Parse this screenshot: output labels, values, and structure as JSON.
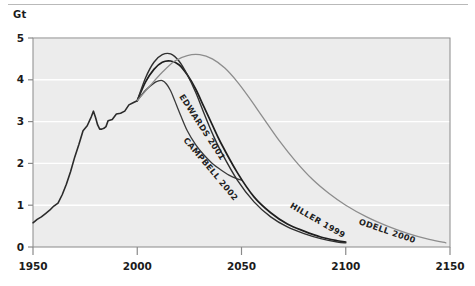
{
  "chart": {
    "unit_label": "Gt",
    "background_color": "#ececec",
    "gridline_color": "#ffffff",
    "axis_color": "#8a8a8a"
  },
  "chart_data": {
    "type": "line",
    "title": "",
    "subtitle": "",
    "xlabel": "",
    "ylabel": "Gt",
    "xlim": [
      1950,
      2150
    ],
    "ylim": [
      0,
      5
    ],
    "xticks": [
      1950,
      2000,
      2050,
      2100,
      2150
    ],
    "yticks": [
      0,
      1,
      2,
      3,
      4,
      5
    ],
    "grid": "horizontal",
    "legend_position": "inline-along-curves",
    "series": [
      {
        "name": "History",
        "label": "",
        "color": "#2b2b2b",
        "width": 1.6,
        "x": [
          1950,
          1952,
          1954,
          1956,
          1958,
          1960,
          1962,
          1964,
          1966,
          1968,
          1970,
          1972,
          1974,
          1976,
          1978,
          1979,
          1980,
          1981,
          1982,
          1983,
          1984,
          1985,
          1986,
          1988,
          1990,
          1992,
          1994,
          1996,
          1998,
          2000
        ],
        "values": [
          0.58,
          0.66,
          0.72,
          0.8,
          0.88,
          0.98,
          1.05,
          1.25,
          1.5,
          1.8,
          2.15,
          2.45,
          2.78,
          2.9,
          3.12,
          3.25,
          3.1,
          2.92,
          2.82,
          2.82,
          2.84,
          2.88,
          3.02,
          3.05,
          3.18,
          3.2,
          3.25,
          3.4,
          3.45,
          3.5
        ]
      },
      {
        "name": "Campbell 2002",
        "label": "CAMPBELL 2002",
        "color": "#3a3a3a",
        "width": 1.3,
        "x": [
          2000,
          2004,
          2008,
          2010,
          2012,
          2014,
          2016,
          2018,
          2020,
          2024,
          2028,
          2032,
          2036,
          2040,
          2044,
          2048,
          2050
        ],
        "values": [
          3.5,
          3.75,
          3.92,
          3.97,
          3.98,
          3.9,
          3.74,
          3.5,
          3.25,
          2.78,
          2.45,
          2.2,
          2.0,
          1.85,
          1.72,
          1.63,
          1.6
        ]
      },
      {
        "name": "Edwards 2001",
        "label": "EDWARDS 2001",
        "color": "#1e1e1e",
        "width": 1.7,
        "x": [
          2000,
          2004,
          2008,
          2012,
          2016,
          2020,
          2024,
          2028,
          2032,
          2036,
          2040,
          2048,
          2056,
          2064,
          2072,
          2080,
          2088,
          2096,
          2100
        ],
        "values": [
          3.5,
          3.95,
          4.25,
          4.42,
          4.45,
          4.36,
          4.12,
          3.78,
          3.35,
          2.92,
          2.5,
          1.78,
          1.2,
          0.82,
          0.55,
          0.38,
          0.24,
          0.15,
          0.12
        ]
      },
      {
        "name": "Hiller 1999",
        "label": "HILLER 1999",
        "color": "#303030",
        "width": 1.4,
        "x": [
          2000,
          2004,
          2008,
          2012,
          2016,
          2020,
          2024,
          2028,
          2032,
          2036,
          2040,
          2048,
          2056,
          2064,
          2072,
          2080,
          2088,
          2096,
          2100
        ],
        "values": [
          3.5,
          4.05,
          4.42,
          4.6,
          4.62,
          4.45,
          4.12,
          3.7,
          3.2,
          2.72,
          2.3,
          1.6,
          1.08,
          0.72,
          0.48,
          0.32,
          0.2,
          0.12,
          0.1
        ]
      },
      {
        "name": "Odell 2000",
        "label": "ODELL 2000",
        "color": "#8d8d8d",
        "width": 1.3,
        "x": [
          2000,
          2006,
          2012,
          2018,
          2024,
          2030,
          2036,
          2042,
          2048,
          2054,
          2060,
          2068,
          2076,
          2084,
          2092,
          2100,
          2110,
          2120,
          2130,
          2140,
          2148
        ],
        "values": [
          3.5,
          3.85,
          4.18,
          4.45,
          4.58,
          4.6,
          4.5,
          4.28,
          3.95,
          3.55,
          3.12,
          2.55,
          2.05,
          1.62,
          1.28,
          1.0,
          0.72,
          0.5,
          0.32,
          0.18,
          0.1
        ]
      }
    ],
    "annotations": [
      {
        "text": "EDWARDS 2001",
        "x": 2020,
        "y": 3.6,
        "rotation": 57
      },
      {
        "text": "CAMPBELL 2002",
        "x": 2022,
        "y": 2.55,
        "rotation": 50
      },
      {
        "text": "HILLER 1999",
        "x": 2073,
        "y": 0.95,
        "rotation": 30
      },
      {
        "text": "ODELL 2000",
        "x": 2106,
        "y": 0.55,
        "rotation": 19
      }
    ]
  }
}
